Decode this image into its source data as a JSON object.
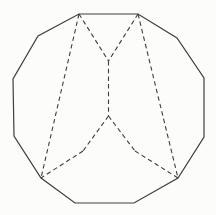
{
  "figure": {
    "kind": "geometry-line-drawing",
    "canvas": {
      "width": 216,
      "height": 215,
      "background": "#fcfcfb"
    },
    "style": {
      "line_color": "#3e3e3e",
      "solid_stroke_width": 1.2,
      "dashed_stroke_width": 1.1,
      "dash_pattern": "4.5,3.2"
    },
    "polygon_vertices": [
      [
        79,
        14
      ],
      [
        138,
        14
      ],
      [
        177,
        38
      ],
      [
        204,
        78
      ],
      [
        204,
        137
      ],
      [
        178,
        178
      ],
      [
        134,
        203
      ],
      [
        75,
        203
      ],
      [
        41,
        178
      ],
      [
        14,
        136
      ],
      [
        13,
        79
      ],
      [
        38,
        36
      ]
    ],
    "interior_points": {
      "v_junction": [
        108.5,
        61
      ],
      "center_junction": [
        108.5,
        116
      ],
      "left_bend": [
        83,
        151
      ],
      "right_bend": [
        135,
        151
      ]
    },
    "dashed_segments": [
      {
        "name": "long-left-diagonal",
        "from": [
          79,
          14
        ],
        "to": [
          41,
          178
        ]
      },
      {
        "name": "long-right-diagonal",
        "from": [
          138,
          14
        ],
        "to": [
          178,
          178
        ]
      },
      {
        "name": "v-left-edge",
        "from": [
          79,
          14
        ],
        "to": [
          108.5,
          61
        ]
      },
      {
        "name": "v-right-edge",
        "from": [
          138,
          14
        ],
        "to": [
          108.5,
          61
        ]
      },
      {
        "name": "vertical-center-edge",
        "from": [
          108.5,
          61
        ],
        "to": [
          108.5,
          116
        ]
      },
      {
        "name": "center-to-left-bend",
        "from": [
          108.5,
          116
        ],
        "to": [
          83,
          151
        ]
      },
      {
        "name": "left-bend-to-bottom-left",
        "from": [
          83,
          151
        ],
        "to": [
          41,
          178
        ]
      },
      {
        "name": "center-to-right-bend",
        "from": [
          108.5,
          116
        ],
        "to": [
          135,
          151
        ]
      },
      {
        "name": "right-bend-to-bottom-right",
        "from": [
          135,
          151
        ],
        "to": [
          178,
          178
        ]
      }
    ]
  }
}
